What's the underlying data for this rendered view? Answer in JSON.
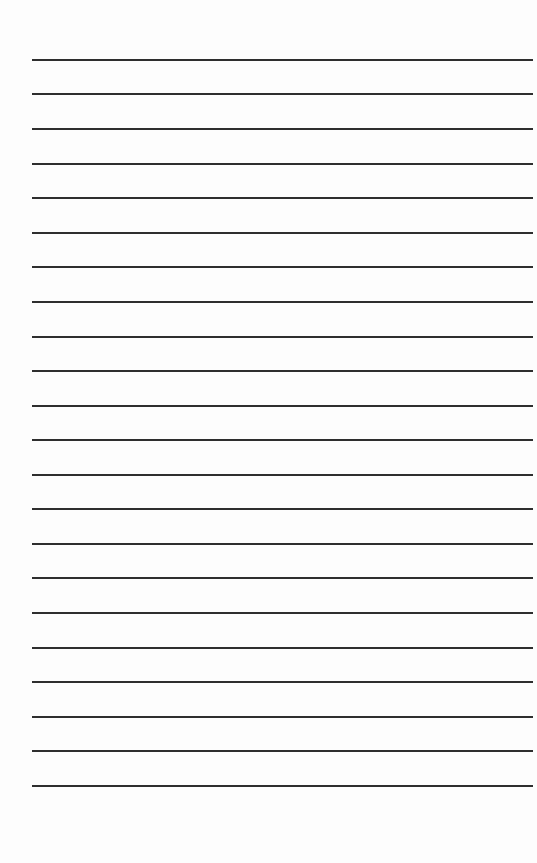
{
  "page": {
    "type": "lined-paper",
    "background_color": "#fdfdfd",
    "line_color": "#2e2e2e",
    "line_count": 22,
    "line_left_px": 32,
    "line_right_px": 533,
    "first_line_y_px": 59,
    "line_spacing_px": 34.57,
    "lines": [
      {
        "y": 59
      },
      {
        "y": 93
      },
      {
        "y": 128
      },
      {
        "y": 163
      },
      {
        "y": 197
      },
      {
        "y": 232
      },
      {
        "y": 266
      },
      {
        "y": 301
      },
      {
        "y": 336
      },
      {
        "y": 370
      },
      {
        "y": 405
      },
      {
        "y": 439
      },
      {
        "y": 474
      },
      {
        "y": 508
      },
      {
        "y": 543
      },
      {
        "y": 577
      },
      {
        "y": 612
      },
      {
        "y": 647
      },
      {
        "y": 681
      },
      {
        "y": 716
      },
      {
        "y": 750
      },
      {
        "y": 785
      }
    ]
  }
}
